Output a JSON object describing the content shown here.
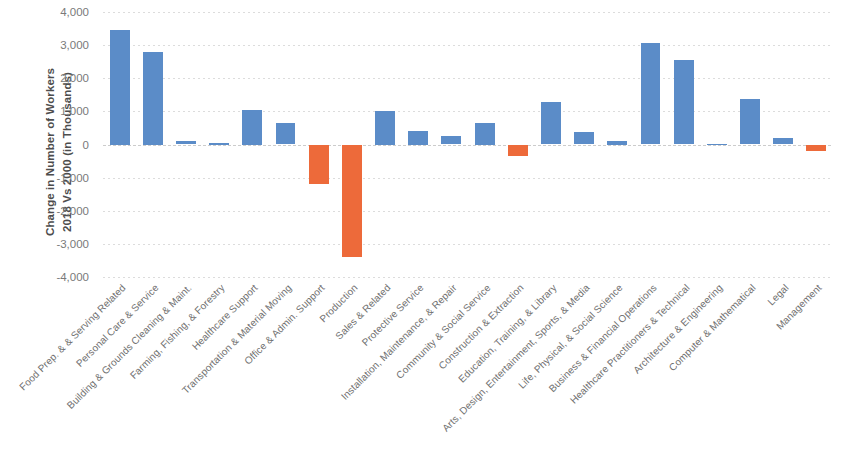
{
  "chart_data": {
    "type": "bar",
    "title": "",
    "subtitle": "",
    "xlabel": "",
    "ylabel": "Change in Number of Workers 2018 Vs 2000 (in Thousands)",
    "ylabel_line1": "Change in Number of Workers",
    "ylabel_line2": "2018 Vs 2000 (in Thousands)",
    "ylim": [
      -4000,
      4000
    ],
    "ytick_values": [
      4000,
      3000,
      2000,
      1000,
      0,
      -1000,
      -2000,
      -3000,
      -4000
    ],
    "ytick_labels": [
      "4,000",
      "3,000",
      "2,000",
      "1,000",
      "0",
      "-1,000",
      "-2,000",
      "-3,000",
      "-4,000"
    ],
    "grid": true,
    "grid_axis": "y",
    "legend": false,
    "legend_position": "none",
    "positive_color": "#5b8cc8",
    "negative_color": "#ed6a3a",
    "categories": [
      "Food Prep. & & Serving Related",
      "Personal Care & Service",
      "Building & Grounds Cleaning & Maint.",
      "Farming, Fishing, & Forestry",
      "Healthcare Support",
      "Transportation & Material Moving",
      "Office & Admin. Support",
      "Production",
      "Sales & Related",
      "Protective Service",
      "Installation, Maintenance, & Repair",
      "Community & Social Service",
      "Construction & Extraction",
      "Education, Training, & Library",
      "Arts, Design, Entertainment, Sports, & Media",
      "Life, Physical, & Social Science",
      "Business & Financial Operations",
      "Healthcare Practitioners & Technical",
      "Architecture & Engineering",
      "Computer & Mathematical",
      "Legal",
      "Management"
    ],
    "values": [
      3450,
      2800,
      120,
      40,
      1050,
      640,
      -1180,
      -3400,
      1000,
      400,
      270,
      650,
      -340,
      1280,
      370,
      100,
      3060,
      2560,
      20,
      1380,
      190,
      -210
    ]
  }
}
